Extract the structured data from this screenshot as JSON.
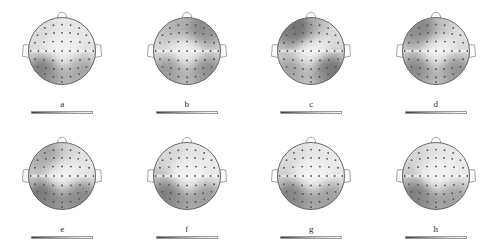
{
  "figure": {
    "type": "eeg-topographic-map-grid",
    "rows": 2,
    "columns": 4,
    "background_color": "#ffffff",
    "colormap": "grayscale",
    "head_outline_color": "#4a4a4a",
    "electrode_marker_color": "#5a5a5a"
  },
  "panels": [
    {
      "label": "a",
      "row": 0,
      "col": 0,
      "colorbar": {
        "min": "",
        "max": "",
        "mid": ""
      },
      "scalp_field": {
        "frontal": 0.18,
        "left_frontal": 0.32,
        "right_frontal": 0.22,
        "central": 0.1,
        "left_temporal": 0.3,
        "right_temporal": 0.28,
        "left_occipital": 0.78,
        "right_occipital": 0.62,
        "midline_occipital": 0.4
      }
    },
    {
      "label": "b",
      "row": 0,
      "col": 1,
      "colorbar": {
        "min": "",
        "max": "",
        "mid": ""
      },
      "scalp_field": {
        "frontal": 0.55,
        "left_frontal": 0.48,
        "right_frontal": 0.7,
        "central": 0.12,
        "left_temporal": 0.3,
        "right_temporal": 0.35,
        "left_occipital": 0.68,
        "right_occipital": 0.72,
        "midline_occipital": 0.35
      }
    },
    {
      "label": "c",
      "row": 0,
      "col": 2,
      "colorbar": {
        "min": "",
        "max": "",
        "mid": ""
      },
      "scalp_field": {
        "frontal": 0.58,
        "left_frontal": 0.8,
        "right_frontal": 0.3,
        "central": 0.12,
        "left_temporal": 0.4,
        "right_temporal": 0.38,
        "left_occipital": 0.62,
        "right_occipital": 0.82,
        "midline_occipital": 0.3
      }
    },
    {
      "label": "d",
      "row": 0,
      "col": 3,
      "colorbar": {
        "min": "",
        "max": "",
        "mid": ""
      },
      "scalp_field": {
        "frontal": 0.5,
        "left_frontal": 0.72,
        "right_frontal": 0.28,
        "central": 0.12,
        "left_temporal": 0.42,
        "right_temporal": 0.34,
        "left_occipital": 0.74,
        "right_occipital": 0.7,
        "midline_occipital": 0.3
      }
    },
    {
      "label": "e",
      "row": 1,
      "col": 0,
      "colorbar": {
        "min": "",
        "max": "",
        "mid": ""
      },
      "scalp_field": {
        "frontal": 0.4,
        "left_frontal": 0.6,
        "right_frontal": 0.24,
        "central": 0.1,
        "left_temporal": 0.42,
        "right_temporal": 0.26,
        "left_occipital": 0.8,
        "right_occipital": 0.74,
        "midline_occipital": 0.55
      }
    },
    {
      "label": "f",
      "row": 1,
      "col": 1,
      "colorbar": {
        "min": "",
        "max": "",
        "mid": ""
      },
      "scalp_field": {
        "frontal": 0.22,
        "left_frontal": 0.34,
        "right_frontal": 0.2,
        "central": 0.08,
        "left_temporal": 0.46,
        "right_temporal": 0.22,
        "left_occipital": 0.78,
        "right_occipital": 0.66,
        "midline_occipital": 0.48
      }
    },
    {
      "label": "g",
      "row": 1,
      "col": 2,
      "colorbar": {
        "min": "",
        "max": "",
        "mid": ""
      },
      "scalp_field": {
        "frontal": 0.2,
        "left_frontal": 0.3,
        "right_frontal": 0.18,
        "central": 0.08,
        "left_temporal": 0.4,
        "right_temporal": 0.24,
        "left_occipital": 0.76,
        "right_occipital": 0.64,
        "midline_occipital": 0.5
      }
    },
    {
      "label": "h",
      "row": 1,
      "col": 3,
      "colorbar": {
        "min": "",
        "max": "",
        "mid": ""
      },
      "scalp_field": {
        "frontal": 0.22,
        "left_frontal": 0.34,
        "right_frontal": 0.18,
        "central": 0.08,
        "left_temporal": 0.44,
        "right_temporal": 0.22,
        "left_occipital": 0.78,
        "right_occipital": 0.62,
        "midline_occipital": 0.52
      }
    }
  ]
}
